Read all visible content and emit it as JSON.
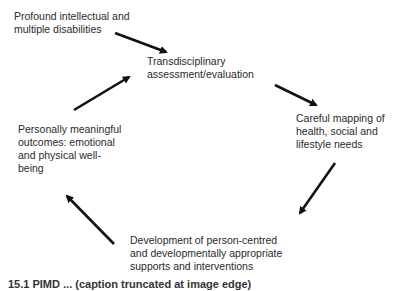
{
  "diagram": {
    "type": "cycle",
    "nodes": [
      {
        "id": "start",
        "lines": [
          "Profound intellectual and",
          "multiple disabilities"
        ]
      },
      {
        "id": "assessment",
        "lines": [
          "Transdisciplinary",
          "assessment/evaluation"
        ]
      },
      {
        "id": "mapping",
        "lines": [
          "Careful mapping of",
          "health, social and",
          "lifestyle needs"
        ]
      },
      {
        "id": "development",
        "lines": [
          "Development of person-centred",
          "and developmentally appropriate",
          "supports and interventions"
        ]
      },
      {
        "id": "outcomes",
        "lines": [
          "Personally meaningful",
          "outcomes: emotional",
          "and physical well-",
          "being"
        ]
      }
    ],
    "edges": [
      {
        "from": "start",
        "to": "assessment"
      },
      {
        "from": "assessment",
        "to": "mapping"
      },
      {
        "from": "mapping",
        "to": "development"
      },
      {
        "from": "development",
        "to": "outcomes"
      },
      {
        "from": "outcomes",
        "to": "assessment"
      }
    ],
    "arrow_color": "#111111",
    "text_color": "#2a2a2a"
  },
  "caption": {
    "text": "15.1  PIMD ... (caption truncated at image edge)"
  }
}
